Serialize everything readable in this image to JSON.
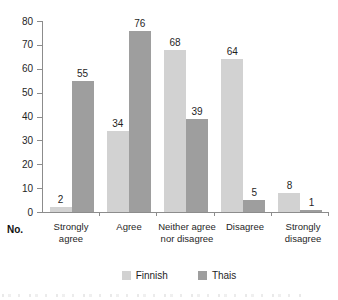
{
  "figure": {
    "axis_corner_label": "No."
  },
  "chart_data": {
    "type": "bar",
    "title": "",
    "categories": [
      "Strongly agree",
      "Agree",
      "Neither agree nor disagree",
      "Disagree",
      "Strongly disagree"
    ],
    "series": [
      {
        "name": "Finnish",
        "color": "#d2d2d2",
        "values": [
          2,
          34,
          68,
          64,
          8
        ]
      },
      {
        "name": "Thais",
        "color": "#9e9e9e",
        "values": [
          55,
          76,
          39,
          5,
          1
        ]
      }
    ],
    "ylim": [
      0,
      80
    ],
    "yticks": [
      0,
      10,
      20,
      30,
      40,
      50,
      60,
      70,
      80
    ],
    "ylabel": "",
    "xlabel": "No.",
    "grid": false,
    "legend_position": "bottom",
    "value_labels": true
  },
  "colors": {
    "axis": "#8c8c8c",
    "text": "#1f1f1f",
    "background": "#ffffff"
  }
}
